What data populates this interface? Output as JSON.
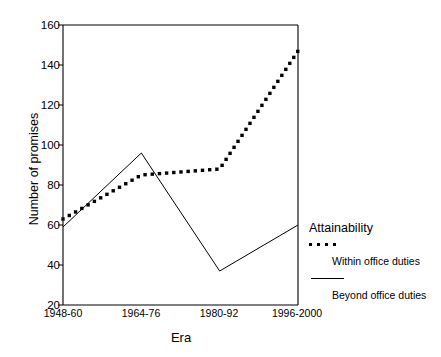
{
  "chart_data": {
    "type": "line",
    "title": "",
    "xlabel": "Era",
    "ylabel": "Number of promises",
    "categories": [
      "1948-60",
      "1964-76",
      "1980-92",
      "1996-2000"
    ],
    "ylim": [
      20,
      160
    ],
    "yticks": [
      20,
      40,
      60,
      80,
      100,
      120,
      140,
      160
    ],
    "grid": false,
    "legend_position": "right",
    "legend_title": "Attainability",
    "series": [
      {
        "name": "Within office duties",
        "style": "dotted",
        "values": [
          63,
          85,
          88,
          147
        ]
      },
      {
        "name": "Beyond office duties",
        "style": "solid",
        "values": [
          59,
          96,
          37,
          60
        ]
      }
    ]
  },
  "axes": {
    "y_title": "Number of promises",
    "x_title": "Era",
    "y_tick_labels": [
      "160",
      "140",
      "120",
      "100",
      "80",
      "60",
      "40",
      "20"
    ],
    "x_tick_labels": [
      "1948-60",
      "1964-76",
      "1980-92",
      "1996-2000"
    ]
  },
  "legend": {
    "title": "Attainability",
    "entries": [
      {
        "label": "Within office duties",
        "marker": "dotted-line"
      },
      {
        "label": "Beyond office duties",
        "marker": "solid-line"
      }
    ]
  },
  "colors": {
    "ink": "#000000",
    "background": "#ffffff"
  }
}
